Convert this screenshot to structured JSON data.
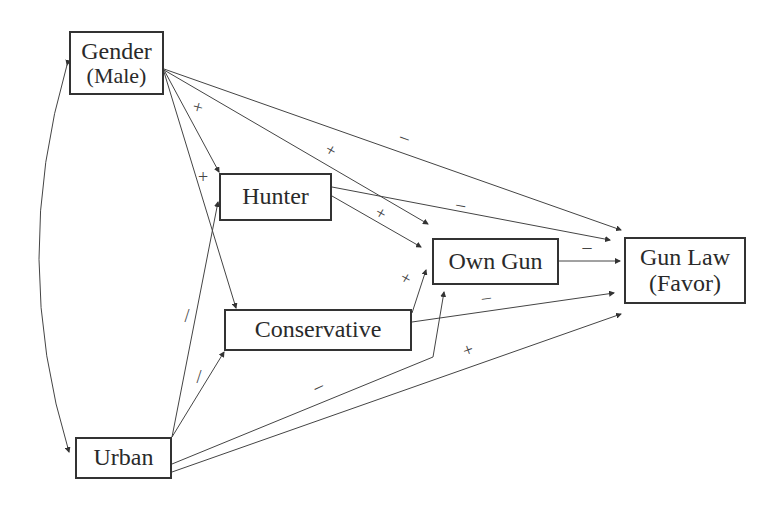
{
  "diagram": {
    "type": "path-diagram",
    "nodes": {
      "gender": {
        "line1": "Gender",
        "line2": "(Male)"
      },
      "hunter": {
        "line1": "Hunter"
      },
      "own_gun": {
        "line1": "Own Gun"
      },
      "gun_law": {
        "line1": "Gun Law",
        "line2": "(Favor)"
      },
      "conservative": {
        "line1": "Conservative"
      },
      "urban": {
        "line1": "Urban"
      }
    },
    "edges": [
      {
        "from": "Gender (Male)",
        "to": "Urban",
        "sign": "",
        "type": "correlation"
      },
      {
        "from": "Gender (Male)",
        "to": "Hunter",
        "sign": "+"
      },
      {
        "from": "Gender (Male)",
        "to": "Conservative",
        "sign": "+"
      },
      {
        "from": "Gender (Male)",
        "to": "Own Gun",
        "sign": "+"
      },
      {
        "from": "Gender (Male)",
        "to": "Gun Law (Favor)",
        "sign": "–"
      },
      {
        "from": "Hunter",
        "to": "Own Gun",
        "sign": "+"
      },
      {
        "from": "Hunter",
        "to": "Gun Law (Favor)",
        "sign": "–"
      },
      {
        "from": "Conservative",
        "to": "Own Gun",
        "sign": "+"
      },
      {
        "from": "Conservative",
        "to": "Gun Law (Favor)",
        "sign": "–"
      },
      {
        "from": "Own Gun",
        "to": "Gun Law (Favor)",
        "sign": "–"
      },
      {
        "from": "Urban",
        "to": "Hunter",
        "sign": "/"
      },
      {
        "from": "Urban",
        "to": "Conservative",
        "sign": "/"
      },
      {
        "from": "Urban",
        "to": "Own Gun",
        "sign": "–"
      },
      {
        "from": "Urban",
        "to": "Gun Law (Favor)",
        "sign": "+"
      }
    ],
    "signs": {
      "g_hunter": "+",
      "g_cons": "+",
      "g_own": "+",
      "g_law": "–",
      "h_own": "+",
      "h_law": "–",
      "c_own": "+",
      "c_law": "–",
      "o_law": "–",
      "u_hunter": "/",
      "u_cons": "/",
      "u_own": "–",
      "u_law": "+"
    }
  }
}
